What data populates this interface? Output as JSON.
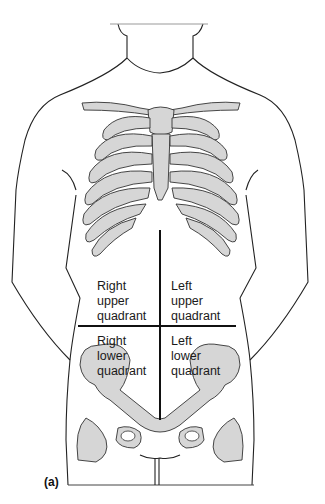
{
  "figure": {
    "panel_label": "(a)",
    "quadrants": [
      {
        "id": "ruq",
        "lines": [
          "Right",
          "upper",
          "quadrant"
        ]
      },
      {
        "id": "luq",
        "lines": [
          "Left",
          "upper",
          "quadrant"
        ]
      },
      {
        "id": "rlq",
        "lines": [
          "Right",
          "lower",
          "quadrant"
        ]
      },
      {
        "id": "llq",
        "lines": [
          "Left",
          "lower",
          "quadrant"
        ]
      }
    ],
    "colors": {
      "outline": "#222222",
      "bone_fill": "#d6d6d6",
      "divider": "#111111",
      "background": "#ffffff"
    }
  }
}
